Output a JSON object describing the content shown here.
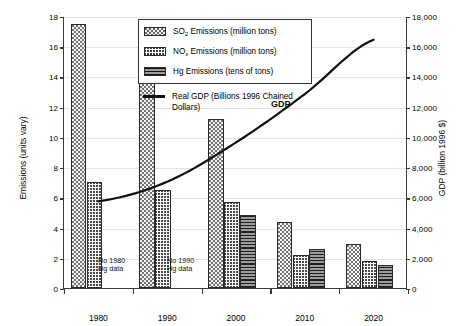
{
  "chart_data": {
    "type": "bar",
    "title": "",
    "categories": [
      "1980",
      "1990",
      "2000",
      "2010",
      "2020"
    ],
    "series": [
      {
        "name": "SO2 Emissions (million tons)",
        "axis": "left",
        "pattern": "dotted",
        "values": [
          17.5,
          15.8,
          11.2,
          4.4,
          2.9
        ]
      },
      {
        "name": "NOx Emissions (million tons)",
        "axis": "left",
        "pattern": "wavy",
        "values": [
          7.0,
          6.5,
          5.7,
          2.2,
          1.8
        ]
      },
      {
        "name": "Hg Emissions (tens of tons)",
        "axis": "left",
        "pattern": "horizontal-lines",
        "values": [
          null,
          null,
          4.8,
          2.6,
          1.5
        ]
      },
      {
        "name": "Real GDP (Billions 1996 Chained Dollars)",
        "axis": "right",
        "type": "line",
        "x": [
          "1980",
          "1990",
          "2000",
          "2010",
          "2020"
        ],
        "values": [
          5800,
          7100,
          9700,
          12900,
          16500
        ]
      }
    ],
    "xlabel": "",
    "ylabel": "Emissions (units vary)",
    "y2label": "GDP (billion 1996 $)",
    "ylim": [
      0,
      18
    ],
    "y2lim": [
      0,
      18000
    ],
    "yticks": [
      "0",
      "2",
      "4",
      "6",
      "8",
      "10",
      "12",
      "14",
      "16",
      "18"
    ],
    "y2ticks": [
      "0",
      "2,000",
      "4,000",
      "6,000",
      "8,000",
      "10,000",
      "12,000",
      "14,000",
      "16,000",
      "18,000"
    ],
    "grid": true,
    "legend_position": "top-center"
  },
  "axes": {
    "left_title": "Emissions (units vary)",
    "right_title": "GDP (billion 1996 $)",
    "left_ticks": [
      "18",
      "16",
      "14",
      "12",
      "10",
      "8",
      "6",
      "4",
      "2",
      "0"
    ],
    "right_ticks": [
      "18,000",
      "16,000",
      "14,000",
      "12,000",
      "10,000",
      "8,000",
      "6,000",
      "4,000",
      "2,000",
      "0"
    ],
    "x_ticks": [
      "1980",
      "1990",
      "2000",
      "2010",
      "2020"
    ]
  },
  "legend": {
    "items": [
      {
        "label_pre": "SO",
        "label_sub": "2",
        "label_post": " Emissions (million tons)",
        "swatch": "so2-dotted-swatch"
      },
      {
        "label_pre": "NO",
        "label_sub": "x",
        "label_post": " Emissions (million tons)",
        "swatch": "nox-wavy-swatch"
      },
      {
        "label_pre": "Hg",
        "label_sub": "",
        "label_post": "  Emissions (tens of tons)",
        "swatch": "hg-lines-swatch"
      }
    ],
    "gdp_label": "Real GDP (Billions 1996 Chained Dollars)"
  },
  "annotations": {
    "no_1980_line1": "No 1980",
    "no_1980_line2": "Hg data",
    "no_1990_line1": "No 1990",
    "no_1990_line2": "Hg data",
    "gdp_inline": "GDP"
  },
  "colors": {
    "axis": "#3a3a3a",
    "grid": "#e2e2e2",
    "line": "#111111",
    "hg_fill": "#9d9d9d",
    "so2_fill": "#f2f2f2",
    "background": "#ffffff"
  }
}
